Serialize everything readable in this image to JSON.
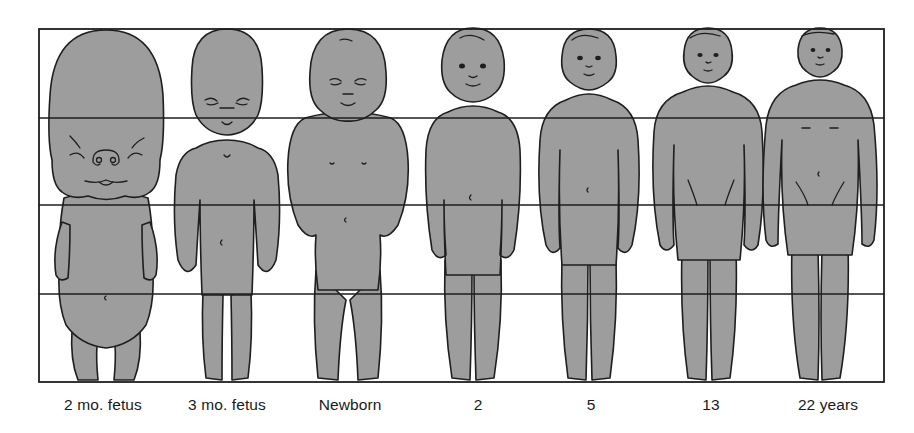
{
  "figure": {
    "title": "",
    "frame": {
      "left": 39,
      "top": 29,
      "right": 884,
      "bottom": 382
    },
    "reference_lines_y": [
      118,
      205,
      294
    ],
    "fill_color": "#9d9d9d",
    "line_color": "#1e1e1e",
    "stages": [
      {
        "label": "2 mo. fetus",
        "center_x": 103
      },
      {
        "label": "3 mo. fetus",
        "center_x": 227
      },
      {
        "label": "Newborn",
        "center_x": 350
      },
      {
        "label": "2",
        "center_x": 478
      },
      {
        "label": "5",
        "center_x": 591
      },
      {
        "label": "13",
        "center_x": 711
      },
      {
        "label": "22 years",
        "center_x": 828
      }
    ]
  }
}
